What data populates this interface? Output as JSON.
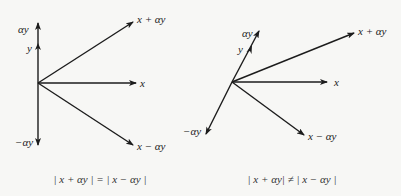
{
  "figure": {
    "left_diagram": {
      "caption": "| x + αy | = | x − αy |",
      "vectors": [
        {
          "name": "alpha-y",
          "label": "αy"
        },
        {
          "name": "y",
          "label": "y"
        },
        {
          "name": "neg-alpha-y",
          "label": "−αy"
        },
        {
          "name": "x",
          "label": "x"
        },
        {
          "name": "x-plus-alpha-y",
          "label": "x + αy"
        },
        {
          "name": "x-minus-alpha-y",
          "label": "x − αy"
        }
      ]
    },
    "right_diagram": {
      "caption": "| x + αy| ≠ | x − αy |",
      "vectors": [
        {
          "name": "alpha-y",
          "label": "αy"
        },
        {
          "name": "y",
          "label": "y"
        },
        {
          "name": "neg-alpha-y",
          "label": "−αy"
        },
        {
          "name": "x",
          "label": "x"
        },
        {
          "name": "x-plus-alpha-y",
          "label": "x + αy"
        },
        {
          "name": "x-minus-alpha-y",
          "label": "x − αy"
        }
      ]
    },
    "colors": {
      "ink": "#1c1c1c",
      "background": "#f7f7f5"
    }
  }
}
